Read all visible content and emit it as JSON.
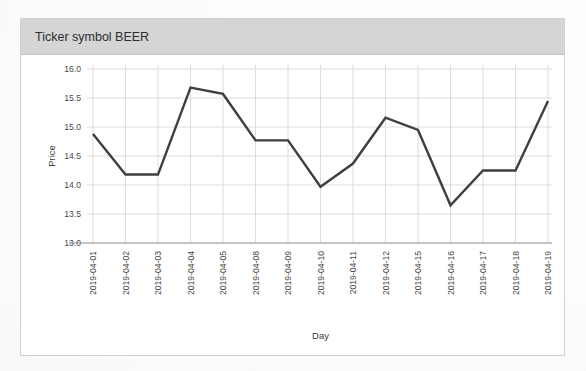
{
  "card": {
    "title": "Ticker symbol BEER"
  },
  "chart_data": {
    "type": "line",
    "title": "",
    "xlabel": "Day",
    "ylabel": "Price",
    "categories": [
      "2019-04-01",
      "2019-04-02",
      "2019-04-03",
      "2019-04-04",
      "2019-04-05",
      "2019-04-08",
      "2019-04-09",
      "2019-04-10",
      "2019-04-11",
      "2019-04-12",
      "2019-04-15",
      "2019-04-16",
      "2019-04-17",
      "2019-04-18",
      "2019-04-19"
    ],
    "values": [
      14.88,
      14.18,
      14.18,
      15.68,
      15.57,
      14.77,
      14.77,
      13.97,
      14.37,
      15.16,
      14.95,
      13.65,
      14.25,
      14.25,
      15.45
    ],
    "ylim": [
      13.0,
      16.0
    ],
    "yticks": [
      "13.0",
      "13.5",
      "14.0",
      "14.5",
      "15.0",
      "15.5",
      "16.0"
    ],
    "ytick_values": [
      13.0,
      13.5,
      14.0,
      14.5,
      15.0,
      15.5,
      16.0
    ],
    "grid": true,
    "legend": "none",
    "line_color": "#3f3f3f",
    "grid_color": "#dcdcdc",
    "axis_color": "#8c8c8c"
  },
  "ghost_text": {
    "title": "the source for the best of",
    "line1": "one of the available in market",
    "line2": "will not in the same",
    "line3": "the report of value",
    "line4": "of the chart table values",
    "line5": "to show the price range",
    "line6": "the last of the data set"
  }
}
